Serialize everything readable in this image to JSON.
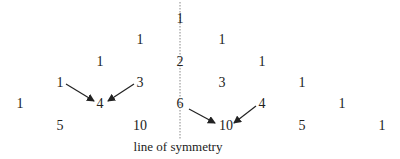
{
  "diagram": {
    "symmetry_line": {
      "x": 180,
      "y1": 2,
      "y2": 140,
      "label": "line of symmetry",
      "label_x": 178,
      "label_y": 153
    },
    "entries": [
      {
        "row": 0,
        "value": "1",
        "x": 180,
        "y": 26
      },
      {
        "row": 1,
        "value": "1",
        "x": 140,
        "y": 47
      },
      {
        "row": 1,
        "value": "1",
        "x": 222,
        "y": 47
      },
      {
        "row": 2,
        "value": "1",
        "x": 100,
        "y": 69
      },
      {
        "row": 2,
        "value": "2",
        "x": 180,
        "y": 69
      },
      {
        "row": 2,
        "value": "1",
        "x": 262,
        "y": 69
      },
      {
        "row": 3,
        "value": "1",
        "x": 60,
        "y": 90
      },
      {
        "row": 3,
        "value": "3",
        "x": 140,
        "y": 90
      },
      {
        "row": 3,
        "value": "3",
        "x": 222,
        "y": 90
      },
      {
        "row": 3,
        "value": "1",
        "x": 302,
        "y": 90
      },
      {
        "row": 4,
        "value": "1",
        "x": 20,
        "y": 111
      },
      {
        "row": 4,
        "value": "4",
        "x": 100,
        "y": 111
      },
      {
        "row": 4,
        "value": "6",
        "x": 180,
        "y": 111
      },
      {
        "row": 4,
        "value": "4",
        "x": 262,
        "y": 111
      },
      {
        "row": 4,
        "value": "1",
        "x": 342,
        "y": 111
      },
      {
        "row": 5,
        "value": "5",
        "x": 60,
        "y": 133
      },
      {
        "row": 5,
        "value": "10",
        "x": 140,
        "y": 133
      },
      {
        "row": 5,
        "value": "10",
        "x": 226,
        "y": 133
      },
      {
        "row": 5,
        "value": "5",
        "x": 302,
        "y": 133
      },
      {
        "row": 5,
        "value": "1",
        "x": 382,
        "y": 133
      }
    ],
    "arrows": [
      {
        "from": "1 (row 3)",
        "to": "4 (row 4)",
        "x1": 66,
        "y1": 84,
        "x2": 94,
        "y2": 101
      },
      {
        "from": "3 (row 3)",
        "to": "4 (row 4)",
        "x1": 134,
        "y1": 84,
        "x2": 108,
        "y2": 101
      },
      {
        "from": "6 (row 4)",
        "to": "10 (row 5)",
        "x1": 189,
        "y1": 109,
        "x2": 215,
        "y2": 123
      },
      {
        "from": "4 (row 4)",
        "to": "10 (row 5)",
        "x1": 256,
        "y1": 106,
        "x2": 234,
        "y2": 123
      }
    ],
    "colors": {
      "text": "#222222",
      "line": "#888888",
      "arrow": "#222222"
    }
  }
}
